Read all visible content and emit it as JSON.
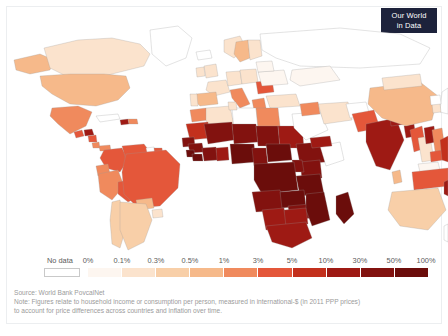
{
  "logo": {
    "line1": "Our World",
    "line2": "in Data",
    "bg": "#1d223b"
  },
  "legend": {
    "no_data_label": "No data",
    "ticks": [
      "0%",
      "0.1%",
      "0.3%",
      "0.5%",
      "1%",
      "3%",
      "5%",
      "10%",
      "30%",
      "50%",
      "100%"
    ],
    "bins": [
      {
        "from": "0%",
        "to": "0.1%",
        "color": "#fdf6f0"
      },
      {
        "from": "0.1%",
        "to": "0.3%",
        "color": "#fbe3cd"
      },
      {
        "from": "0.3%",
        "to": "0.5%",
        "color": "#f8cfa8"
      },
      {
        "from": "0.5%",
        "to": "1%",
        "color": "#f6b98a"
      },
      {
        "from": "1%",
        "to": "3%",
        "color": "#f08a5d"
      },
      {
        "from": "3%",
        "to": "5%",
        "color": "#e4573a"
      },
      {
        "from": "5%",
        "to": "10%",
        "color": "#c3301d"
      },
      {
        "from": "10%",
        "to": "30%",
        "color": "#9e1a14"
      },
      {
        "from": "30%",
        "to": "50%",
        "color": "#82120f"
      },
      {
        "from": "50%",
        "to": "100%",
        "color": "#6b0d0b"
      }
    ],
    "no_data_color": "#ffffff"
  },
  "footer": {
    "source": "Source: World Bank PovcalNet",
    "note_line1": "Note: Figures relate to household income or consumption per person, measured in international-$ (in 2011 PPP prices)",
    "note_line2": "to account for price differences across countries and inflation over time."
  },
  "chart_data": {
    "type": "heatmap",
    "title": "",
    "legend_position": "bottom",
    "value_unit": "percent of population",
    "scale_type": "binned-sequential",
    "bin_edges": [
      0,
      0.1,
      0.3,
      0.5,
      1,
      3,
      5,
      10,
      30,
      50,
      100
    ],
    "regions": [
      {
        "name": "Canada",
        "value": "0.1%-0.3%",
        "color": "#fbe3cd"
      },
      {
        "name": "Greenland",
        "value": "no data",
        "color": "#ffffff"
      },
      {
        "name": "Alaska",
        "value": "0.5%-1%",
        "color": "#f6b98a"
      },
      {
        "name": "United States",
        "value": "0.5%-1%",
        "color": "#f6b98a"
      },
      {
        "name": "Mexico",
        "value": "1%-3%",
        "color": "#f08a5d"
      },
      {
        "name": "Guatemala",
        "value": "3%-5%",
        "color": "#e4573a"
      },
      {
        "name": "Honduras",
        "value": "10%-30%",
        "color": "#9e1a14"
      },
      {
        "name": "Nicaragua",
        "value": "3%-5%",
        "color": "#e4573a"
      },
      {
        "name": "Costa Rica",
        "value": "1%-3%",
        "color": "#f08a5d"
      },
      {
        "name": "Panama",
        "value": "1%-3%",
        "color": "#f08a5d"
      },
      {
        "name": "Cuba",
        "value": "no data",
        "color": "#ffffff"
      },
      {
        "name": "Haiti",
        "value": "10%-30%",
        "color": "#9e1a14"
      },
      {
        "name": "Dominican Republic",
        "value": "1%-3%",
        "color": "#f08a5d"
      },
      {
        "name": "Colombia",
        "value": "3%-5%",
        "color": "#e4573a"
      },
      {
        "name": "Venezuela",
        "value": "3%-5%",
        "color": "#e4573a"
      },
      {
        "name": "Guyana",
        "value": "no data",
        "color": "#ffffff"
      },
      {
        "name": "Suriname",
        "value": "3%-5%",
        "color": "#e4573a"
      },
      {
        "name": "Ecuador",
        "value": "1%-3%",
        "color": "#f08a5d"
      },
      {
        "name": "Peru",
        "value": "1%-3%",
        "color": "#f08a5d"
      },
      {
        "name": "Bolivia",
        "value": "3%-5%",
        "color": "#e4573a"
      },
      {
        "name": "Brazil",
        "value": "3%-5%",
        "color": "#e4573a"
      },
      {
        "name": "Paraguay",
        "value": "0.5%-1%",
        "color": "#f6b98a"
      },
      {
        "name": "Chile",
        "value": "0.3%-0.5%",
        "color": "#f8cfa8"
      },
      {
        "name": "Argentina",
        "value": "0.3%-0.5%",
        "color": "#f8cfa8"
      },
      {
        "name": "Uruguay",
        "value": "0.1%-0.3%",
        "color": "#fbe3cd"
      },
      {
        "name": "Iceland",
        "value": "no data",
        "color": "#ffffff"
      },
      {
        "name": "Norway",
        "value": "0.1%-0.3%",
        "color": "#fbe3cd"
      },
      {
        "name": "Sweden",
        "value": "0.5%-1%",
        "color": "#f6b98a"
      },
      {
        "name": "Finland",
        "value": "0.1%-0.3%",
        "color": "#fbe3cd"
      },
      {
        "name": "United Kingdom",
        "value": "0.1%-0.3%",
        "color": "#fbe3cd"
      },
      {
        "name": "Ireland",
        "value": "0.1%-0.3%",
        "color": "#fbe3cd"
      },
      {
        "name": "France",
        "value": "0.1%-0.3%",
        "color": "#fbe3cd"
      },
      {
        "name": "Spain",
        "value": "0.5%-1%",
        "color": "#f6b98a"
      },
      {
        "name": "Portugal",
        "value": "0.1%-0.3%",
        "color": "#fbe3cd"
      },
      {
        "name": "Germany",
        "value": "0.1%-0.3%",
        "color": "#fbe3cd"
      },
      {
        "name": "Poland",
        "value": "0.1%-0.3%",
        "color": "#fbe3cd"
      },
      {
        "name": "Italy",
        "value": "1%-3%",
        "color": "#f08a5d"
      },
      {
        "name": "Romania",
        "value": "3%-5%",
        "color": "#e4573a"
      },
      {
        "name": "Ukraine",
        "value": "0%-0.1%",
        "color": "#fdf6f0"
      },
      {
        "name": "Belarus",
        "value": "0%-0.1%",
        "color": "#fdf6f0"
      },
      {
        "name": "Greece",
        "value": "1%-3%",
        "color": "#f08a5d"
      },
      {
        "name": "Turkey",
        "value": "0.1%-0.3%",
        "color": "#fbe3cd"
      },
      {
        "name": "Russia",
        "value": "no data",
        "color": "#ffffff"
      },
      {
        "name": "Kazakhstan",
        "value": "0%-0.1%",
        "color": "#fdf6f0"
      },
      {
        "name": "Morocco",
        "value": "1%-3%",
        "color": "#f08a5d"
      },
      {
        "name": "Algeria",
        "value": "0.1%-0.3%",
        "color": "#fbe3cd"
      },
      {
        "name": "Libya",
        "value": "no data",
        "color": "#ffffff"
      },
      {
        "name": "Egypt",
        "value": "1%-3%",
        "color": "#f08a5d"
      },
      {
        "name": "Tunisia",
        "value": "0.1%-0.3%",
        "color": "#fbe3cd"
      },
      {
        "name": "Mauritania",
        "value": "5%-10%",
        "color": "#c3301d"
      },
      {
        "name": "Mali",
        "value": "30%-50%",
        "color": "#82120f"
      },
      {
        "name": "Niger",
        "value": "30%-50%",
        "color": "#82120f"
      },
      {
        "name": "Chad",
        "value": "30%-50%",
        "color": "#82120f"
      },
      {
        "name": "Sudan",
        "value": "10%-30%",
        "color": "#9e1a14"
      },
      {
        "name": "Senegal",
        "value": "30%-50%",
        "color": "#82120f"
      },
      {
        "name": "Guinea",
        "value": "30%-50%",
        "color": "#82120f"
      },
      {
        "name": "Sierra Leone",
        "value": "50%-100%",
        "color": "#6b0d0b"
      },
      {
        "name": "Liberia",
        "value": "50%-100%",
        "color": "#6b0d0b"
      },
      {
        "name": "Ivory Coast",
        "value": "30%-50%",
        "color": "#82120f"
      },
      {
        "name": "Ghana",
        "value": "10%-30%",
        "color": "#9e1a14"
      },
      {
        "name": "Nigeria",
        "value": "50%-100%",
        "color": "#6b0d0b"
      },
      {
        "name": "Cameroon",
        "value": "30%-50%",
        "color": "#82120f"
      },
      {
        "name": "Central African Republic",
        "value": "50%-100%",
        "color": "#6b0d0b"
      },
      {
        "name": "Ethiopia",
        "value": "30%-50%",
        "color": "#82120f"
      },
      {
        "name": "Somalia",
        "value": "no data",
        "color": "#ffffff"
      },
      {
        "name": "Kenya",
        "value": "30%-50%",
        "color": "#82120f"
      },
      {
        "name": "Uganda",
        "value": "30%-50%",
        "color": "#82120f"
      },
      {
        "name": "Tanzania",
        "value": "50%-100%",
        "color": "#6b0d0b"
      },
      {
        "name": "DR Congo",
        "value": "50%-100%",
        "color": "#6b0d0b"
      },
      {
        "name": "Angola",
        "value": "30%-50%",
        "color": "#82120f"
      },
      {
        "name": "Zambia",
        "value": "50%-100%",
        "color": "#6b0d0b"
      },
      {
        "name": "Zimbabwe",
        "value": "30%-50%",
        "color": "#82120f"
      },
      {
        "name": "Mozambique",
        "value": "50%-100%",
        "color": "#6b0d0b"
      },
      {
        "name": "Madagascar",
        "value": "50%-100%",
        "color": "#6b0d0b"
      },
      {
        "name": "Namibia",
        "value": "10%-30%",
        "color": "#9e1a14"
      },
      {
        "name": "Botswana",
        "value": "10%-30%",
        "color": "#9e1a14"
      },
      {
        "name": "South Africa",
        "value": "10%-30%",
        "color": "#9e1a14"
      },
      {
        "name": "Saudi Arabia",
        "value": "no data",
        "color": "#ffffff"
      },
      {
        "name": "Iran",
        "value": "0.1%-0.3%",
        "color": "#fbe3cd"
      },
      {
        "name": "Iraq",
        "value": "1%-3%",
        "color": "#f08a5d"
      },
      {
        "name": "Yemen",
        "value": "10%-30%",
        "color": "#9e1a14"
      },
      {
        "name": "Afghanistan",
        "value": "no data",
        "color": "#ffffff"
      },
      {
        "name": "Pakistan",
        "value": "3%-5%",
        "color": "#e4573a"
      },
      {
        "name": "India",
        "value": "10%-30%",
        "color": "#9e1a14"
      },
      {
        "name": "Nepal",
        "value": "10%-30%",
        "color": "#9e1a14"
      },
      {
        "name": "Bangladesh",
        "value": "10%-30%",
        "color": "#9e1a14"
      },
      {
        "name": "Sri Lanka",
        "value": "0.5%-1%",
        "color": "#f6b98a"
      },
      {
        "name": "China",
        "value": "0.5%-1%",
        "color": "#f6b98a"
      },
      {
        "name": "Mongolia",
        "value": "0.1%-0.3%",
        "color": "#fbe3cd"
      },
      {
        "name": "Japan",
        "value": "no data",
        "color": "#ffffff"
      },
      {
        "name": "South Korea",
        "value": "0.1%-0.3%",
        "color": "#fbe3cd"
      },
      {
        "name": "North Korea",
        "value": "no data",
        "color": "#ffffff"
      },
      {
        "name": "Myanmar",
        "value": "3%-5%",
        "color": "#e4573a"
      },
      {
        "name": "Thailand",
        "value": "0.1%-0.3%",
        "color": "#fbe3cd"
      },
      {
        "name": "Laos",
        "value": "10%-30%",
        "color": "#9e1a14"
      },
      {
        "name": "Vietnam",
        "value": "1%-3%",
        "color": "#f08a5d"
      },
      {
        "name": "Cambodia",
        "value": "3%-5%",
        "color": "#e4573a"
      },
      {
        "name": "Malaysia",
        "value": "0%-0.1%",
        "color": "#fdf6f0"
      },
      {
        "name": "Indonesia",
        "value": "3%-5%",
        "color": "#e4573a"
      },
      {
        "name": "Philippines",
        "value": "5%-10%",
        "color": "#c3301d"
      },
      {
        "name": "Papua New Guinea",
        "value": "10%-30%",
        "color": "#9e1a14"
      },
      {
        "name": "Australia",
        "value": "0.3%-0.5%",
        "color": "#f8cfa8"
      },
      {
        "name": "New Zealand",
        "value": "no data",
        "color": "#ffffff"
      }
    ]
  }
}
